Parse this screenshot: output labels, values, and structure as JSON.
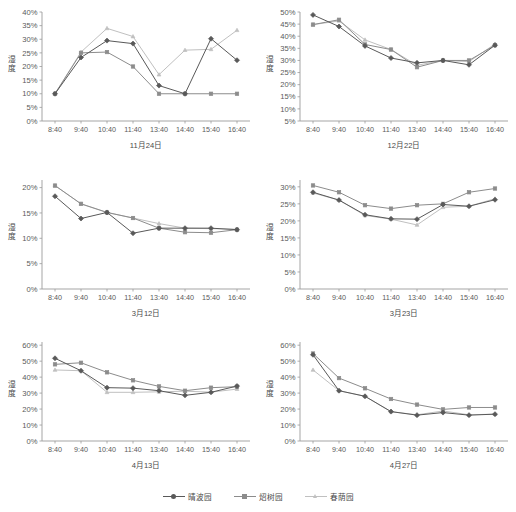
{
  "figure": {
    "ylabel": "湿度",
    "x_categories": [
      "8:40",
      "9:40",
      "10:40",
      "11:40",
      "13:40",
      "14:40",
      "15:40",
      "16:40"
    ]
  },
  "legend": {
    "position": "bottom-center",
    "items": [
      {
        "label": "晴波园",
        "color": "#595959",
        "marker": "diamond"
      },
      {
        "label": "炤树园",
        "color": "#8c8c8c",
        "marker": "square"
      },
      {
        "label": "春荫园",
        "color": "#c0c0c0",
        "marker": "triangle"
      }
    ]
  },
  "chart_data": [
    {
      "type": "line",
      "title": "11月24日",
      "xlabel": "11月24日",
      "ylabel": "湿度",
      "grid": false,
      "ylim": [
        0,
        40
      ],
      "ytick_labels": [
        "0%",
        "5%",
        "10%",
        "15%",
        "20%",
        "25%",
        "30%",
        "35%",
        "40%"
      ],
      "ytick_values": [
        0,
        5,
        10,
        15,
        20,
        25,
        30,
        35,
        40
      ],
      "x": [
        "8:40",
        "9:40",
        "10:40",
        "11:40",
        "13:40",
        "14:40",
        "15:40",
        "16:40"
      ],
      "series": [
        {
          "name": "晴波园",
          "color": "#595959",
          "values": [
            10.0,
            23.3,
            29.5,
            28.4,
            13.0,
            10.0,
            30.2,
            22.3
          ]
        },
        {
          "name": "炤树园",
          "color": "#8c8c8c",
          "values": [
            10.0,
            25.0,
            25.3,
            20.0,
            10.0,
            10.0,
            10.0,
            10.0
          ]
        },
        {
          "name": "春荫园",
          "color": "#c0c0c0",
          "values": [
            10.0,
            25.3,
            34.0,
            31.0,
            17.0,
            26.0,
            26.3,
            33.3
          ]
        }
      ]
    },
    {
      "type": "line",
      "title": "12月22日",
      "xlabel": "12月22日",
      "ylabel": "湿度",
      "grid": false,
      "ylim": [
        5,
        50
      ],
      "ytick_labels": [
        "5%",
        "10%",
        "15%",
        "20%",
        "25%",
        "30%",
        "35%",
        "40%",
        "45%",
        "50%"
      ],
      "ytick_values": [
        5,
        10,
        15,
        20,
        25,
        30,
        35,
        40,
        45,
        50
      ],
      "x": [
        "8:40",
        "9:40",
        "10:40",
        "11:40",
        "13:40",
        "14:40",
        "15:40",
        "16:40"
      ],
      "series": [
        {
          "name": "晴波园",
          "color": "#595959",
          "values": [
            48.8,
            44.0,
            36.0,
            31.0,
            29.0,
            30.0,
            28.2,
            36.3
          ]
        },
        {
          "name": "炤树园",
          "color": "#8c8c8c",
          "values": [
            44.8,
            46.8,
            36.6,
            34.5,
            27.2,
            30.0,
            30.0,
            36.3
          ]
        },
        {
          "name": "春荫园",
          "color": "#c0c0c0",
          "values": [
            44.8,
            46.3,
            38.5,
            34.5,
            28.0,
            30.0,
            29.5,
            36.8
          ]
        }
      ]
    },
    {
      "type": "line",
      "title": "3月12日",
      "xlabel": "3月12日",
      "ylabel": "湿度",
      "grid": false,
      "ylim": [
        0,
        21.5
      ],
      "ytick_labels": [
        "0%",
        "5%",
        "10%",
        "15%",
        "20%"
      ],
      "ytick_values": [
        0,
        5,
        10,
        15,
        20
      ],
      "x": [
        "8:40",
        "9:40",
        "10:40",
        "11:40",
        "13:40",
        "14:40",
        "15:40",
        "16:40"
      ],
      "series": [
        {
          "name": "晴波园",
          "color": "#595959",
          "values": [
            18.3,
            13.9,
            15.1,
            11.0,
            12.0,
            12.0,
            12.0,
            11.7
          ]
        },
        {
          "name": "炤树园",
          "color": "#8c8c8c",
          "values": [
            20.4,
            16.8,
            15.1,
            14.0,
            12.0,
            11.2,
            11.1,
            11.7
          ]
        },
        {
          "name": "春荫园",
          "color": "#c0c0c0",
          "values": [
            20.4,
            16.8,
            15.1,
            14.0,
            12.9,
            12.0,
            11.9,
            11.8
          ]
        }
      ]
    },
    {
      "type": "line",
      "title": "3月23日",
      "xlabel": "3月23日",
      "ylabel": "湿度",
      "grid": false,
      "ylim": [
        0,
        32
      ],
      "ytick_labels": [
        "0%",
        "5%",
        "10%",
        "15%",
        "20%",
        "25%",
        "30%"
      ],
      "ytick_values": [
        0,
        5,
        10,
        15,
        20,
        25,
        30
      ],
      "x": [
        "8:40",
        "9:40",
        "10:40",
        "11:40",
        "13:40",
        "14:40",
        "15:40",
        "16:40"
      ],
      "series": [
        {
          "name": "晴波园",
          "color": "#595959",
          "values": [
            28.4,
            26.1,
            21.8,
            20.6,
            20.5,
            24.8,
            24.3,
            26.2
          ]
        },
        {
          "name": "炤树园",
          "color": "#8c8c8c",
          "values": [
            30.4,
            28.4,
            24.6,
            23.6,
            24.6,
            25.0,
            28.4,
            29.5
          ]
        },
        {
          "name": "春荫园",
          "color": "#c0c0c0",
          "values": [
            28.2,
            26.1,
            21.6,
            20.5,
            18.8,
            24.0,
            24.3,
            26.5
          ]
        }
      ]
    },
    {
      "type": "line",
      "title": "4月13日",
      "xlabel": "4月13日",
      "ylabel": "湿度",
      "grid": false,
      "ylim": [
        0,
        62
      ],
      "ytick_labels": [
        "0%",
        "10%",
        "20%",
        "30%",
        "40%",
        "50%",
        "60%"
      ],
      "ytick_values": [
        0,
        10,
        20,
        30,
        40,
        50,
        60
      ],
      "x": [
        "8:40",
        "9:40",
        "10:40",
        "11:40",
        "13:40",
        "14:40",
        "15:40",
        "16:40"
      ],
      "series": [
        {
          "name": "晴波园",
          "color": "#595959",
          "values": [
            51.8,
            44.0,
            33.4,
            33.1,
            31.5,
            28.6,
            30.5,
            34.4
          ]
        },
        {
          "name": "炤树园",
          "color": "#8c8c8c",
          "values": [
            48.0,
            49.0,
            43.0,
            38.0,
            34.2,
            31.5,
            33.4,
            34.0
          ]
        },
        {
          "name": "春荫园",
          "color": "#c0c0c0",
          "values": [
            44.5,
            44.0,
            30.5,
            30.5,
            30.8,
            31.2,
            30.6,
            32.5
          ]
        }
      ]
    },
    {
      "type": "line",
      "title": "4月27日",
      "xlabel": "4月27日",
      "ylabel": "湿度",
      "grid": false,
      "ylim": [
        0,
        62
      ],
      "ytick_labels": [
        "0%",
        "10%",
        "20%",
        "30%",
        "40%",
        "50%",
        "60%"
      ],
      "ytick_values": [
        0,
        10,
        20,
        30,
        40,
        50,
        60
      ],
      "x": [
        "8:40",
        "9:40",
        "10:40",
        "11:40",
        "13:40",
        "14:40",
        "15:40",
        "16:40"
      ],
      "series": [
        {
          "name": "晴波园",
          "color": "#595959",
          "values": [
            54.0,
            31.5,
            28.0,
            18.4,
            16.2,
            17.8,
            16.2,
            16.8
          ]
        },
        {
          "name": "炤树园",
          "color": "#8c8c8c",
          "values": [
            54.8,
            39.4,
            33.0,
            26.3,
            22.8,
            19.8,
            21.0,
            21.0
          ]
        },
        {
          "name": "春荫园",
          "color": "#c0c0c0",
          "values": [
            44.5,
            31.5,
            28.0,
            18.4,
            16.4,
            18.8,
            16.4,
            16.8
          ]
        }
      ]
    }
  ]
}
